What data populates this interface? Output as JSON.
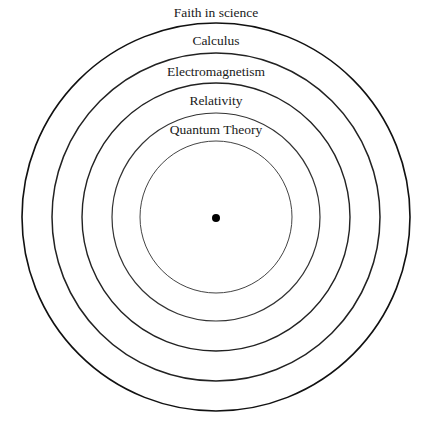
{
  "diagram": {
    "center": {
      "x": 216,
      "y": 217
    },
    "dot": {
      "r": 4,
      "color": "#000000"
    },
    "rings": [
      {
        "label": "Faith in science",
        "r": 194,
        "label_y": 17,
        "stroke": "#111111",
        "stroke_width": 1.6
      },
      {
        "label": "Calculus",
        "r": 164,
        "label_y": 45,
        "stroke": "#222222",
        "stroke_width": 1.5
      },
      {
        "label": "Electromagnetism",
        "r": 134,
        "label_y": 76,
        "stroke": "#222222",
        "stroke_width": 1.4
      },
      {
        "label": "Relativity",
        "r": 104,
        "label_y": 105,
        "stroke": "#333333",
        "stroke_width": 1.2
      },
      {
        "label": "Quantum Theory",
        "r": 76,
        "label_y": 134,
        "stroke": "#444444",
        "stroke_width": 1.0
      }
    ]
  }
}
